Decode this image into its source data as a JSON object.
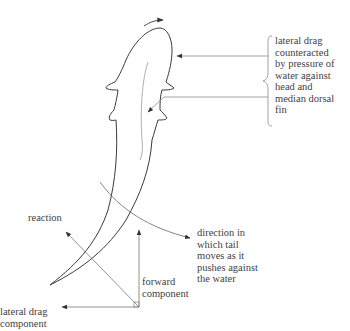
{
  "diagram": {
    "labels": {
      "lateral_drag_note": "lateral drag\ncounteracted\nby pressure of\nwater against\nhead and\nmedian dorsal\nfin",
      "tail_direction": "direction in\nwhich tail\nmoves as it\npushes against\nthe water",
      "reaction": "reaction",
      "forward_component": "forward\ncomponent",
      "lateral_drag_component": "lateral drag\ncomponent"
    },
    "colors": {
      "outline": "#3a3a3a",
      "leader_line": "#8a8a8a",
      "text": "#3f3f3f"
    }
  }
}
